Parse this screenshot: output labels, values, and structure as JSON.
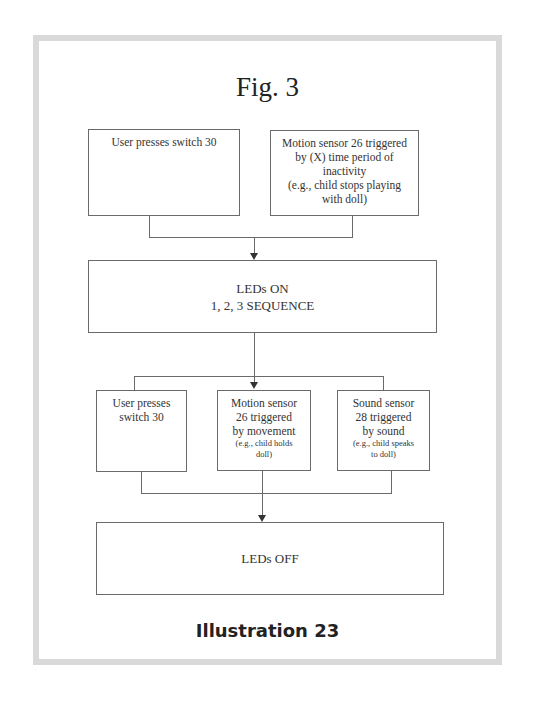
{
  "figure": {
    "title": "Fig. 3",
    "caption": "Illustration 23"
  },
  "flowchart": {
    "triggers_on": [
      {
        "id": "user-switch-on",
        "lines": [
          "User presses switch 30"
        ]
      },
      {
        "id": "motion-inactivity",
        "lines": [
          "Motion sensor 26 triggered",
          "by (X) time period of",
          "inactivity",
          "(e.g., child stops playing",
          "with doll)"
        ]
      }
    ],
    "leds_on": {
      "lines": [
        "LEDs ON",
        "1, 2, 3 SEQUENCE"
      ]
    },
    "triggers_off": [
      {
        "id": "user-switch-off",
        "lines": [
          "User presses",
          "switch 30"
        ],
        "note": []
      },
      {
        "id": "motion-movement",
        "lines": [
          "Motion sensor",
          "26 triggered",
          "by movement"
        ],
        "note": [
          "(e.g., child holds",
          "doll)"
        ]
      },
      {
        "id": "sound-sensor",
        "lines": [
          "Sound sensor",
          "28 triggered",
          "by sound"
        ],
        "note": [
          "(e.g., child speaks",
          "to doll)"
        ]
      }
    ],
    "leds_off": {
      "lines": [
        "LEDs OFF"
      ]
    }
  },
  "colors": {
    "frame_border": "#d9d9d9",
    "box_border": "#6a6a6a",
    "text": "#333333"
  }
}
